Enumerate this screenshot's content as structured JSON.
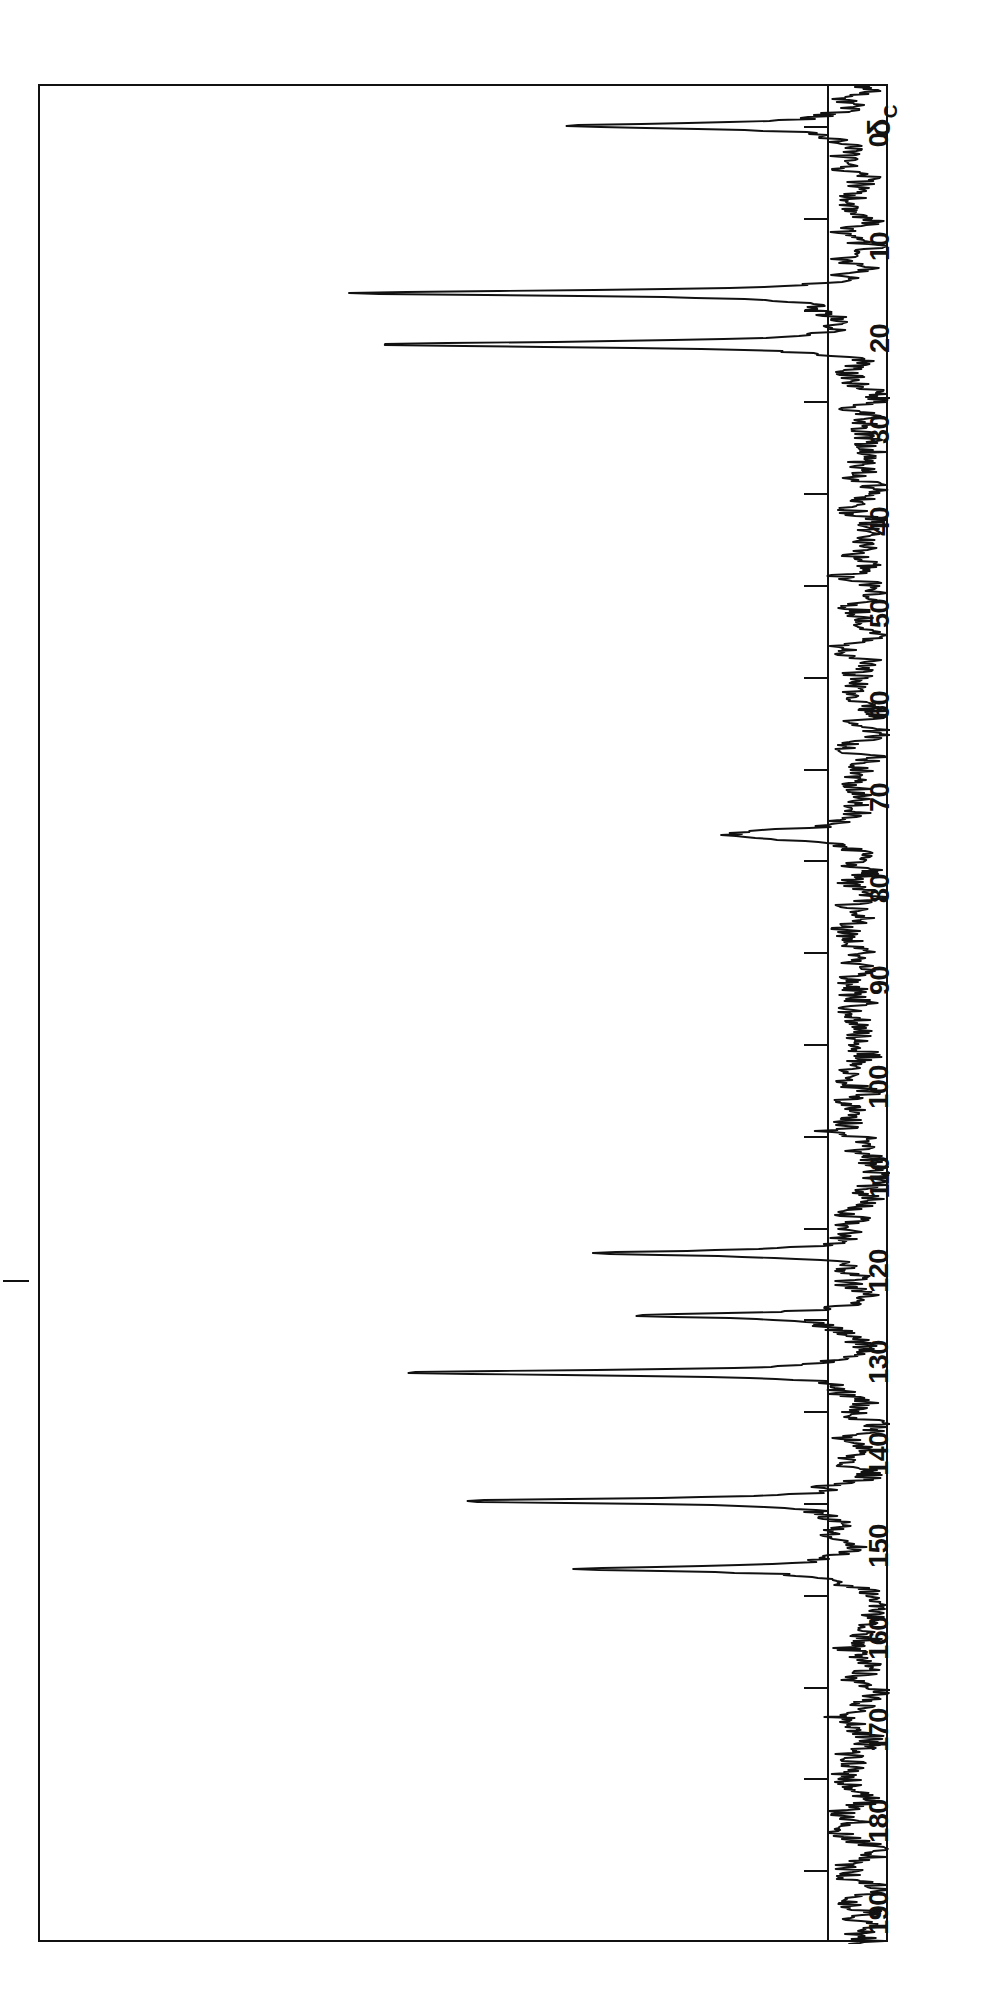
{
  "figure": {
    "kind": "nmr-spectrum",
    "nucleus_label": "δ",
    "nucleus_subscript": "C",
    "orientation": "rotated-90"
  },
  "axis": {
    "label": "δC",
    "unit": "ppm",
    "min": 0,
    "max": 195,
    "tick_step": 10,
    "tick_labels": [
      "0",
      "10",
      "20",
      "30",
      "40",
      "50",
      "60",
      "70",
      "80",
      "90",
      "100",
      "110",
      "120",
      "130",
      "140",
      "150",
      "160",
      "170",
      "180",
      "190"
    ],
    "tick_values": [
      0,
      10,
      20,
      30,
      40,
      50,
      60,
      70,
      80,
      90,
      100,
      110,
      120,
      130,
      140,
      150,
      160,
      170,
      180,
      190
    ]
  },
  "colors": {
    "trace": "#111111",
    "frame": "#111111",
    "background": "#ffffff"
  },
  "chart_data": {
    "type": "line",
    "title": "",
    "xlabel": "δC",
    "ylabel": "",
    "xlim": [
      195,
      -3
    ],
    "grid": false,
    "legend": null,
    "baseline_intensity": 0.0,
    "noise_amplitude": 0.035,
    "peaks": [
      {
        "shift": 0.0,
        "intensity": 0.38,
        "label": "TMS"
      },
      {
        "shift": 18.2,
        "intensity": 0.66,
        "label": ""
      },
      {
        "shift": 23.8,
        "intensity": 0.62,
        "label": ""
      },
      {
        "shift": 76.8,
        "intensity": 0.07,
        "label": "CDCl3"
      },
      {
        "shift": 77.2,
        "intensity": 0.08,
        "label": "CDCl3"
      },
      {
        "shift": 77.6,
        "intensity": 0.07,
        "label": "CDCl3"
      },
      {
        "shift": 109.5,
        "intensity": 0.06,
        "label": ""
      },
      {
        "shift": 122.8,
        "intensity": 0.37,
        "label": ""
      },
      {
        "shift": 129.6,
        "intensity": 0.29,
        "label": ""
      },
      {
        "shift": 135.8,
        "intensity": 0.56,
        "label": ""
      },
      {
        "shift": 149.8,
        "intensity": 0.5,
        "label": ""
      },
      {
        "shift": 157.2,
        "intensity": 0.34,
        "label": ""
      }
    ]
  }
}
